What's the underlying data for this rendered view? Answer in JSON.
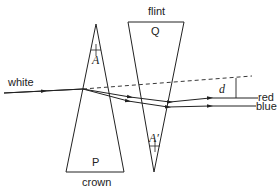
{
  "diagram": {
    "prisms": [
      {
        "id": "P",
        "label": "P",
        "material": "crown",
        "angle_label": "A"
      },
      {
        "id": "Q",
        "label": "Q",
        "material": "flint",
        "angle_label": "A′"
      }
    ],
    "rays": {
      "incident": "white",
      "emergent": [
        "red",
        "blue"
      ]
    },
    "deviation_label": "d",
    "colors": {
      "line": "#222222",
      "background": "#ffffff"
    }
  }
}
